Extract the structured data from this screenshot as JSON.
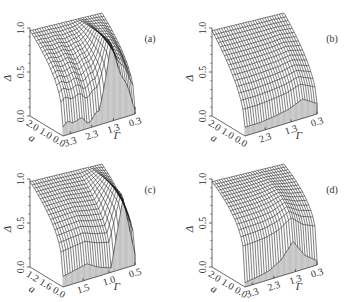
{
  "figure": {
    "panels": [
      {
        "label": "(a)",
        "zlabel": "Δ",
        "xlabel": "a",
        "ylabel": "Γ",
        "z_ticks": [
          "0.0",
          "0.5",
          "1.0"
        ],
        "a_ticks": [
          "2.0",
          "1.0",
          "0.0"
        ],
        "gamma_ticks": [
          "3.3",
          "2.3",
          "1.3",
          "0.3"
        ]
      },
      {
        "label": "(b)",
        "zlabel": "Δ",
        "xlabel": "a",
        "ylabel": "Γ",
        "z_ticks": [
          "0.0",
          "0.5",
          "1.0"
        ],
        "a_ticks": [
          "2.0",
          "1.0",
          "0.0"
        ],
        "gamma_ticks": [
          "2.3",
          "1.3",
          "0.3"
        ]
      },
      {
        "label": "(c)",
        "zlabel": "Δ",
        "xlabel": "a",
        "ylabel": "Γ",
        "z_ticks": [
          "0.0",
          "0.5",
          "1.0"
        ],
        "a_ticks": [
          "1.2",
          "1.6",
          "0.0"
        ],
        "gamma_ticks": [
          "1.5",
          "1.0",
          "0.5"
        ]
      },
      {
        "label": "(d)",
        "zlabel": "Δ",
        "xlabel": "a",
        "ylabel": "Γ",
        "z_ticks": [
          "0.0",
          "0.5",
          "1.0"
        ],
        "a_ticks": [
          "2.0",
          "1.0",
          "0.0"
        ],
        "gamma_ticks": [
          "3.3",
          "2.3",
          "1.3",
          "0.3"
        ]
      }
    ]
  },
  "chart_data": [
    {
      "type": "surface3d",
      "title": "(a)",
      "xlabel": "a",
      "ylabel": "Γ",
      "zlabel": "Δ",
      "x_range": [
        0.0,
        2.0
      ],
      "y_range": [
        0.3,
        3.3
      ],
      "zlim": [
        0.0,
        1.0
      ],
      "x_ticks": [
        2.0,
        1.0,
        0.0
      ],
      "y_ticks": [
        3.3,
        2.3,
        1.3,
        0.3
      ],
      "z_ticks": [
        0.0,
        0.5,
        1.0
      ],
      "description": "Δ≈1 at a=0 for all Γ; decreases with a toward ~0 at large a; oscillatory ripples along Γ near Δ≈0.1; sharp ridge/dip near Γ≈1.3 (Δ rises to ~0.9) then drops near Γ≈0.3",
      "edge_profile_gamma": [
        3.3,
        2.8,
        2.3,
        1.8,
        1.3,
        0.8,
        0.3
      ],
      "edge_profile_delta_at_max_a": [
        0.1,
        0.15,
        0.08,
        0.14,
        0.85,
        0.45,
        0.08
      ]
    },
    {
      "type": "surface3d",
      "title": "(b)",
      "xlabel": "a",
      "ylabel": "Γ",
      "zlabel": "Δ",
      "x_range": [
        0.0,
        2.0
      ],
      "y_range": [
        0.3,
        2.8
      ],
      "zlim": [
        0.0,
        1.0
      ],
      "x_ticks": [
        2.0,
        1.0,
        0.0
      ],
      "y_ticks": [
        2.3,
        1.3,
        0.3
      ],
      "z_ticks": [
        0.0,
        0.5,
        1.0
      ],
      "description": "Smooth monotonic decay of Δ from ~0.95 at a=0 to ~0.1 at a=2; small bump near Γ≈0.5 (Δ~0.25)",
      "edge_profile_gamma": [
        2.8,
        2.3,
        1.8,
        1.3,
        0.8,
        0.3
      ],
      "edge_profile_delta_at_max_a": [
        0.1,
        0.1,
        0.12,
        0.15,
        0.22,
        0.12
      ]
    },
    {
      "type": "surface3d",
      "title": "(c)",
      "xlabel": "a",
      "ylabel": "Γ",
      "zlabel": "Δ",
      "x_range": [
        0.0,
        1.6
      ],
      "y_range": [
        0.5,
        1.5
      ],
      "zlim": [
        0.0,
        1.0
      ],
      "x_ticks": [
        1.2,
        1.6,
        0.0
      ],
      "y_ticks": [
        1.5,
        1.0,
        0.5
      ],
      "z_ticks": [
        0.0,
        0.5,
        1.0
      ],
      "description": "Δ≈1 at a=0; decays with a; deep trough near Γ≈0.9 then ridge (Δ~0.8) near Γ≈0.7",
      "edge_profile_gamma": [
        1.7,
        1.5,
        1.3,
        1.1,
        0.9,
        0.7,
        0.5
      ],
      "edge_profile_delta_at_max_a": [
        0.12,
        0.15,
        0.18,
        0.1,
        0.05,
        0.8,
        0.12
      ]
    },
    {
      "type": "surface3d",
      "title": "(d)",
      "xlabel": "a",
      "ylabel": "Γ",
      "zlabel": "Δ",
      "x_range": [
        0.0,
        2.0
      ],
      "y_range": [
        0.3,
        3.3
      ],
      "zlim": [
        0.0,
        1.0
      ],
      "x_ticks": [
        2.0,
        1.0,
        0.0
      ],
      "y_ticks": [
        3.3,
        2.3,
        1.3,
        0.3
      ],
      "z_ticks": [
        0.0,
        0.5,
        1.0
      ],
      "description": "Δ≈1 plateau at small a, dropping steeply to ~0.05 at large a; peak near Γ≈1.0 (Δ~0.35) on far edge",
      "edge_profile_gamma": [
        3.3,
        2.8,
        2.3,
        1.8,
        1.3,
        0.8,
        0.3
      ],
      "edge_profile_delta_at_max_a": [
        0.05,
        0.07,
        0.1,
        0.18,
        0.35,
        0.15,
        0.05
      ]
    }
  ]
}
